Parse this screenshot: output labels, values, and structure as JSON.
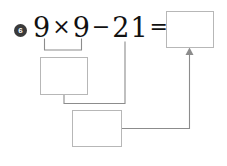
{
  "page": {
    "background_color": "#ffffff",
    "line_color": "#8c8c8c",
    "box_border_color": "#b7b7b7",
    "ink_color": "#111111"
  },
  "problem": {
    "number_label": "6",
    "marker_icon": "circled-number-icon",
    "equation": {
      "full_text": "9 × 9 − 21 =",
      "tokens": [
        {
          "text": "9",
          "type": "operand"
        },
        {
          "text": "×",
          "type": "operator"
        },
        {
          "text": "9",
          "type": "operand"
        },
        {
          "text": "−",
          "type": "operator"
        },
        {
          "text": "21",
          "type": "operand"
        },
        {
          "text": "=",
          "type": "operator"
        }
      ],
      "first_operand": "9",
      "multiply_sign": "×",
      "second_operand": "9",
      "minus_sign": "−",
      "subtrahend": "21",
      "equals_sign": "="
    }
  },
  "boxes": [
    {
      "name": "result-box",
      "value": "",
      "placeholder": "",
      "role": "final answer box at right of equals sign"
    },
    {
      "name": "product-box",
      "value": "",
      "placeholder": "",
      "role": "box for the product of 9 times 9"
    },
    {
      "name": "difference-box",
      "value": "",
      "placeholder": "",
      "role": "box for the difference after subtracting 21"
    }
  ],
  "connectors": {
    "underbrace_label": "grouping bracket under 9 times 9",
    "product_to_difference_label": "line from product box to difference box",
    "subtrahend_to_difference_label": "line from 21 down to difference box",
    "difference_to_result_label": "arrow from difference box up into result box",
    "arrow_icon": "up-arrow-icon"
  }
}
